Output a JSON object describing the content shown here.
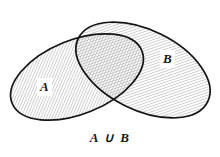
{
  "figure": {
    "name": "venn-diagram-union",
    "type": "venn-diagram",
    "background_color": "#ffffff",
    "outline_color": "#141414",
    "hatch_color": "#9a9a9a",
    "text_color": "#151515",
    "caption": "A ∪ B",
    "caption_plain": "A U B",
    "sets": [
      {
        "id": "set-a",
        "label": "A",
        "shape": "ellipse",
        "center_x": 77,
        "center_y": 77,
        "radius_x": 70,
        "radius_y": 37,
        "rotation_deg": -22,
        "shaded": true
      },
      {
        "id": "set-b",
        "label": "B",
        "shape": "ellipse",
        "center_x": 143,
        "center_y": 70,
        "radius_x": 72,
        "radius_y": 40,
        "rotation_deg": 26,
        "shaded": true
      }
    ],
    "hatch": {
      "angle_deg": 45,
      "spacing_px": 2.6,
      "line_width_px": 0.9
    },
    "labels": {
      "set_a": "A",
      "set_b": "B"
    }
  }
}
